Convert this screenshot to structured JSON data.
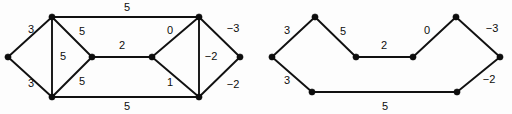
{
  "figure": {
    "background_color": "#fdfdfd",
    "ink_color": "#0d0d0d"
  },
  "graphs": [
    {
      "name": "left-graph",
      "vertices": [
        {
          "id": "L0",
          "name": "vertex-left-apex",
          "x": 8,
          "y": 57
        },
        {
          "id": "L1",
          "name": "vertex-upper-left",
          "x": 52,
          "y": 17
        },
        {
          "id": "L2",
          "name": "vertex-lower-left",
          "x": 52,
          "y": 97
        },
        {
          "id": "L3",
          "name": "vertex-mid-left",
          "x": 92,
          "y": 57
        },
        {
          "id": "L4",
          "name": "vertex-mid-right",
          "x": 152,
          "y": 57
        },
        {
          "id": "L5",
          "name": "vertex-upper-right",
          "x": 199,
          "y": 17
        },
        {
          "id": "L6",
          "name": "vertex-lower-right",
          "x": 199,
          "y": 97
        },
        {
          "id": "L7",
          "name": "vertex-right-apex",
          "x": 240,
          "y": 57
        }
      ],
      "edges": [
        {
          "name": "edge-L0-L1",
          "from": "L0",
          "to": "L1",
          "weight": "3",
          "lx": 31,
          "ly": 30
        },
        {
          "name": "edge-L0-L2",
          "from": "L0",
          "to": "L2",
          "weight": "3",
          "lx": 31,
          "ly": 84
        },
        {
          "name": "edge-L1-L2",
          "from": "L1",
          "to": "L2",
          "weight": "5",
          "lx": 63,
          "ly": 57
        },
        {
          "name": "edge-L1-L3",
          "from": "L1",
          "to": "L3",
          "weight": "5",
          "lx": 82,
          "ly": 32
        },
        {
          "name": "edge-L2-L3",
          "from": "L2",
          "to": "L3",
          "weight": "5",
          "lx": 82,
          "ly": 82
        },
        {
          "name": "edge-L1-L5",
          "from": "L1",
          "to": "L5",
          "weight": "5",
          "lx": 127,
          "ly": 8
        },
        {
          "name": "edge-L2-L6",
          "from": "L2",
          "to": "L6",
          "weight": "5",
          "lx": 127,
          "ly": 107
        },
        {
          "name": "edge-L3-L4",
          "from": "L3",
          "to": "L4",
          "weight": "2",
          "lx": 122,
          "ly": 46
        },
        {
          "name": "edge-L4-L5",
          "from": "L4",
          "to": "L5",
          "weight": "0",
          "lx": 170,
          "ly": 31
        },
        {
          "name": "edge-L4-L6",
          "from": "L4",
          "to": "L6",
          "weight": "1",
          "lx": 170,
          "ly": 83
        },
        {
          "name": "edge-L5-L6",
          "from": "L5",
          "to": "L6",
          "weight": "-2",
          "lx": 211,
          "ly": 57
        },
        {
          "name": "edge-L5-L7",
          "from": "L5",
          "to": "L7",
          "weight": "-3",
          "lx": 233,
          "ly": 29
        },
        {
          "name": "edge-L6-L7",
          "from": "L6",
          "to": "L7",
          "weight": "-2",
          "lx": 233,
          "ly": 85
        }
      ]
    },
    {
      "name": "right-graph",
      "vertices": [
        {
          "id": "R0",
          "name": "vertex-left-apex",
          "x": 272,
          "y": 57
        },
        {
          "id": "R1",
          "name": "vertex-upper-left",
          "x": 315,
          "y": 17
        },
        {
          "id": "R2",
          "name": "vertex-lower-left",
          "x": 312,
          "y": 92
        },
        {
          "id": "R3",
          "name": "vertex-mid-left",
          "x": 356,
          "y": 57
        },
        {
          "id": "R4",
          "name": "vertex-mid-right",
          "x": 413,
          "y": 57
        },
        {
          "id": "R5",
          "name": "vertex-upper-right",
          "x": 456,
          "y": 17
        },
        {
          "id": "R6",
          "name": "vertex-lower-right",
          "x": 457,
          "y": 92
        },
        {
          "id": "R7",
          "name": "vertex-right-apex",
          "x": 500,
          "y": 57
        }
      ],
      "edges": [
        {
          "name": "edge-R0-R1",
          "from": "R0",
          "to": "R1",
          "weight": "3",
          "lx": 287,
          "ly": 31
        },
        {
          "name": "edge-R0-R2",
          "from": "R0",
          "to": "R2",
          "weight": "3",
          "lx": 287,
          "ly": 81
        },
        {
          "name": "edge-R1-R3",
          "from": "R1",
          "to": "R3",
          "weight": "5",
          "lx": 343,
          "ly": 32
        },
        {
          "name": "edge-R3-R4",
          "from": "R3",
          "to": "R4",
          "weight": "2",
          "lx": 384,
          "ly": 46
        },
        {
          "name": "edge-R4-R5",
          "from": "R4",
          "to": "R5",
          "weight": "0",
          "lx": 427,
          "ly": 31
        },
        {
          "name": "edge-R5-R7",
          "from": "R5",
          "to": "R7",
          "weight": "-3",
          "lx": 492,
          "ly": 29
        },
        {
          "name": "edge-R6-R7",
          "from": "R6",
          "to": "R7",
          "weight": "-2",
          "lx": 489,
          "ly": 80
        },
        {
          "name": "edge-R2-R6",
          "from": "R2",
          "to": "R6",
          "weight": "5",
          "lx": 385,
          "ly": 107
        }
      ]
    }
  ]
}
